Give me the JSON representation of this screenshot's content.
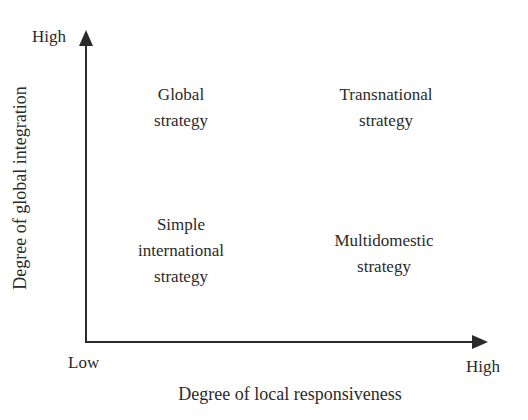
{
  "diagram": {
    "type": "2x2-matrix",
    "x_axis": {
      "title": "Degree of local responsiveness",
      "low_label": "Low",
      "high_label": "High"
    },
    "y_axis": {
      "title": "Degree of global integration",
      "high_label": "High"
    },
    "quadrants": {
      "top_left": {
        "line1": "Global",
        "line2": "strategy"
      },
      "top_right": {
        "line1": "Transnational",
        "line2": "strategy"
      },
      "bottom_left": {
        "line1": "Simple",
        "line2": "international",
        "line3": "strategy"
      },
      "bottom_right": {
        "line1": "Multidomestic",
        "line2": "strategy"
      }
    },
    "colors": {
      "ink": "#2a2a2a",
      "background": "#ffffff"
    }
  }
}
